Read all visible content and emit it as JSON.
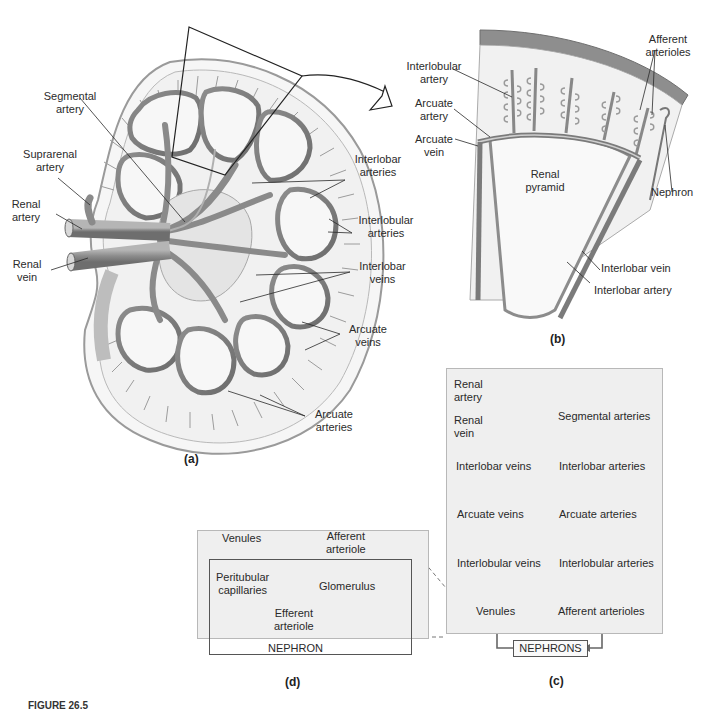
{
  "figure": {
    "caption_fragment": "FIGURE 26.5"
  },
  "panel_a": {
    "label": "(a)",
    "labels": {
      "segmental_artery": "Segmental\nartery",
      "suprarenal_artery": "Suprarenal\nartery",
      "renal_artery": "Renal\nartery",
      "renal_vein": "Renal\nvein",
      "interlobar_arteries": "Interlobar\narteries",
      "interlobular_arteries": "Interlobular\narteries",
      "interlobar_veins": "Interlobar\nveins",
      "arcuate_veins": "Arcuate\nveins",
      "arcuate_arteries": "Arcuate\narteries"
    }
  },
  "panel_b": {
    "label": "(b)",
    "labels": {
      "interlobular_artery": "Interlobular\nartery",
      "arcuate_artery": "Arcuate\nartery",
      "arcuate_vein": "Arcuate\nvein",
      "renal_pyramid": "Renal\npyramid",
      "afferent_arterioles": "Afferent\narterioles",
      "nephron": "Nephron",
      "interlobar_vein": "Interlobar vein",
      "interlobar_artery": "Interlobar artery"
    }
  },
  "panel_c": {
    "label": "(c)",
    "arterial_path": [
      "Renal\nartery",
      "Segmental arteries",
      "Interlobar arteries",
      "Arcuate arteries",
      "Interlobular arteries",
      "Afferent arterioles"
    ],
    "nephrons": "NEPHRONS",
    "venous_path": [
      "Venules",
      "Interlobular veins",
      "Arcuate veins",
      "Interlobar veins",
      "Renal\nvein"
    ]
  },
  "panel_d": {
    "label": "(d)",
    "venules": "Venules",
    "afferent_arteriole": "Afferent\narteriole",
    "peritubular_capillaries": "Peritubular\ncapillaries",
    "glomerulus": "Glomerulus",
    "efferent_arteriole": "Efferent\narteriole",
    "nephron": "NEPHRON"
  },
  "colors": {
    "vessel_gray": "#8a8a8a",
    "vessel_dark": "#6a6a6a",
    "box_fill": "#efefef",
    "capsule_gray": "#7d7d7d"
  }
}
